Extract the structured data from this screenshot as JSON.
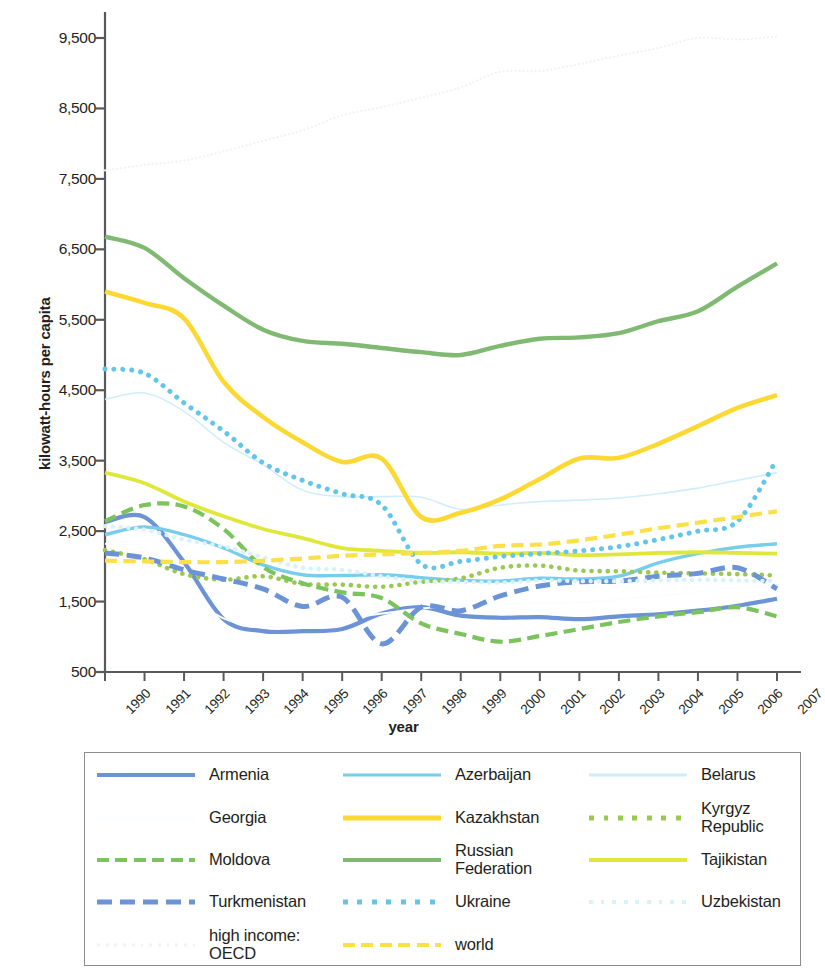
{
  "chart_data": {
    "type": "line",
    "title": "",
    "xlabel": "year",
    "ylabel": "kilowatt-hours per capita",
    "x": [
      1990,
      1991,
      1992,
      1993,
      1994,
      1995,
      1996,
      1997,
      1998,
      1999,
      2000,
      2001,
      2002,
      2003,
      2004,
      2005,
      2006,
      2007
    ],
    "xtick_labels": [
      "1990",
      "1991",
      "1992",
      "1993",
      "1994",
      "1995",
      "1996",
      "1997",
      "1998",
      "1999",
      "2000",
      "2001",
      "2002",
      "2003",
      "2004",
      "2005",
      "2006",
      "2007"
    ],
    "ytick_labels": [
      "500",
      "1,500",
      "2,500",
      "3,500",
      "4,500",
      "5,500",
      "6,500",
      "7,500",
      "8,500",
      "9,500"
    ],
    "ytick_values": [
      500,
      1500,
      2500,
      3500,
      4500,
      5500,
      6500,
      7500,
      8500,
      9500
    ],
    "ylim": [
      500,
      9900
    ],
    "xlim": [
      1990,
      2007
    ],
    "grid": false,
    "legend_position": "below",
    "series": [
      {
        "name": "Armenia",
        "color": "#6b93d6",
        "style": "solid",
        "width": 4.2,
        "values": [
          2630,
          2700,
          2060,
          1250,
          1080,
          1080,
          1110,
          1330,
          1420,
          1300,
          1270,
          1280,
          1250,
          1290,
          1320,
          1370,
          1440,
          1540
        ]
      },
      {
        "name": "Azerbaijan",
        "color": "#79cdec",
        "style": "solid",
        "width": 3.4,
        "values": [
          2450,
          2560,
          2450,
          2260,
          2020,
          1880,
          1870,
          1880,
          1840,
          1800,
          1790,
          1830,
          1820,
          1860,
          2050,
          2180,
          2270,
          2320
        ]
      },
      {
        "name": "Belarus",
        "color": "#cfeefb",
        "style": "solid",
        "width": 1.6,
        "values": [
          4370,
          4460,
          4200,
          3760,
          3440,
          3080,
          2990,
          2990,
          2980,
          2810,
          2870,
          2920,
          2940,
          2970,
          3030,
          3110,
          3220,
          3330
        ]
      },
      {
        "name": "Georgia",
        "color": "#fbfdff",
        "style": "solid",
        "width": 2.0,
        "values": [
          2320,
          2250,
          1660,
          1260,
          1150,
          1160,
          1250,
          1330,
          1400,
          1440,
          1460,
          1480,
          1490,
          1530,
          1580,
          1640,
          1700,
          1740
        ]
      },
      {
        "name": "Kazakhstan",
        "color": "#fcd833",
        "style": "solid",
        "width": 4.6,
        "values": [
          5900,
          5740,
          5520,
          4620,
          4120,
          3760,
          3480,
          3530,
          2700,
          2760,
          2950,
          3240,
          3530,
          3540,
          3740,
          3990,
          4250,
          4430
        ]
      },
      {
        "name": "Kyrgyz Republic",
        "color": "#9bc950",
        "style": "dotted",
        "width": 4.6,
        "values": [
          2230,
          2100,
          1890,
          1810,
          1860,
          1750,
          1740,
          1710,
          1780,
          1830,
          1980,
          2010,
          1940,
          1930,
          1910,
          1900,
          1890,
          1870
        ]
      },
      {
        "name": "Moldova",
        "color": "#7bc35c",
        "style": "dashed",
        "width": 4.2,
        "values": [
          2640,
          2870,
          2850,
          2530,
          1990,
          1760,
          1630,
          1550,
          1190,
          1040,
          930,
          1010,
          1110,
          1210,
          1290,
          1350,
          1420,
          1290
        ]
      },
      {
        "name": "Russian Federation",
        "color": "#7fb972",
        "style": "solid",
        "width": 4.4,
        "values": [
          6680,
          6520,
          6090,
          5700,
          5360,
          5200,
          5160,
          5100,
          5040,
          5000,
          5130,
          5230,
          5250,
          5310,
          5480,
          5620,
          5970,
          6300
        ]
      },
      {
        "name": "Tajikistan",
        "color": "#dfe83a",
        "style": "solid",
        "width": 3.8,
        "values": [
          3330,
          3180,
          2920,
          2710,
          2530,
          2400,
          2260,
          2220,
          2190,
          2200,
          2180,
          2190,
          2160,
          2170,
          2190,
          2200,
          2190,
          2180
        ]
      },
      {
        "name": "Turkmenistan",
        "color": "#6b93d6",
        "style": "dashed",
        "width": 5.0,
        "values": [
          2190,
          2120,
          1950,
          1820,
          1680,
          1430,
          1560,
          900,
          1420,
          1370,
          1580,
          1720,
          1780,
          1790,
          1860,
          1900,
          1980,
          1680
        ]
      },
      {
        "name": "Ukraine",
        "color": "#63c6e8",
        "style": "dotted",
        "width": 5.0,
        "values": [
          4800,
          4740,
          4320,
          3920,
          3470,
          3220,
          3030,
          2870,
          2030,
          2070,
          2140,
          2180,
          2220,
          2280,
          2380,
          2500,
          2640,
          3520
        ]
      },
      {
        "name": "Uzbekistan",
        "color": "#d6f2fb",
        "style": "dotted",
        "width": 4.4,
        "values": [
          2570,
          2520,
          2380,
          2280,
          2130,
          1980,
          1950,
          1860,
          1790,
          1780,
          1770,
          1800,
          1790,
          1790,
          1800,
          1810,
          1800,
          1790
        ]
      },
      {
        "name": "high income: OECD",
        "color": "#f2f2f2",
        "style": "dotted",
        "width": 2.2,
        "values": [
          7620,
          7700,
          7760,
          7890,
          8040,
          8190,
          8400,
          8520,
          8650,
          8800,
          9020,
          9030,
          9130,
          9250,
          9360,
          9500,
          9480,
          9520
        ]
      },
      {
        "name": "world",
        "color": "#fce04a",
        "style": "dashed",
        "width": 4.2,
        "values": [
          2080,
          2070,
          2060,
          2060,
          2080,
          2110,
          2150,
          2170,
          2190,
          2220,
          2290,
          2310,
          2370,
          2450,
          2540,
          2620,
          2700,
          2780
        ]
      }
    ]
  },
  "axis": {
    "ylabel": "kilowatt-hours per capita",
    "xlabel": "year"
  },
  "legend": {
    "items": [
      {
        "label": "Armenia",
        "series": "Armenia"
      },
      {
        "label": "Azerbaijan",
        "series": "Azerbaijan"
      },
      {
        "label": "Belarus",
        "series": "Belarus"
      },
      {
        "label": "Georgia",
        "series": "Georgia"
      },
      {
        "label": "Kazakhstan",
        "series": "Kazakhstan"
      },
      {
        "label": "Kyrgyz Republic",
        "series": "Kyrgyz Republic"
      },
      {
        "label": "Moldova",
        "series": "Moldova"
      },
      {
        "label": "Russian Federation",
        "series": "Russian Federation"
      },
      {
        "label": "Tajikistan",
        "series": "Tajikistan"
      },
      {
        "label": "Turkmenistan",
        "series": "Turkmenistan"
      },
      {
        "label": "Ukraine",
        "series": "Ukraine"
      },
      {
        "label": "Uzbekistan",
        "series": "Uzbekistan"
      },
      {
        "label": "high income: OECD",
        "series": "high income: OECD"
      },
      {
        "label": "world",
        "series": "world"
      }
    ]
  }
}
